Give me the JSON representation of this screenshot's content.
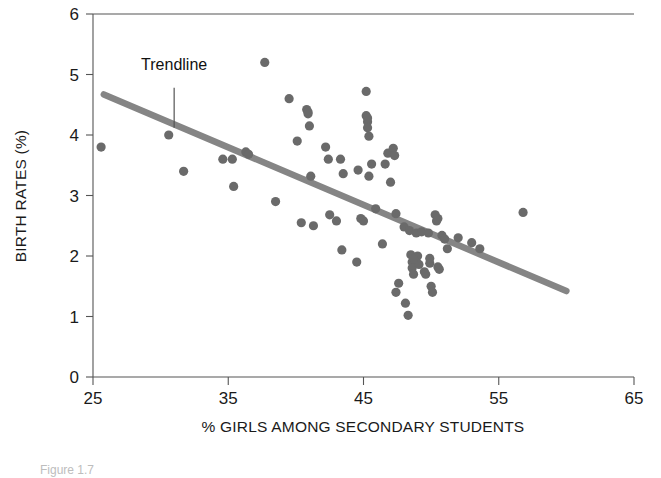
{
  "chart_data": {
    "type": "scatter",
    "title": "",
    "xlabel": "% GIRLS AMONG SECONDARY STUDENTS",
    "ylabel": "BIRTH RATES (%)",
    "xlim": [
      25,
      65
    ],
    "ylim": [
      0,
      6
    ],
    "xticks": [
      25,
      35,
      45,
      55,
      65
    ],
    "yticks": [
      0,
      1,
      2,
      3,
      4,
      5,
      6
    ],
    "xtick_labels": [
      "25",
      "35",
      "45",
      "55",
      "65"
    ],
    "ytick_labels": [
      "0",
      "1",
      "2",
      "3",
      "4",
      "5",
      "6"
    ],
    "grid": false,
    "legend": false,
    "point_color": "#6a6a6a",
    "trendline_color": "#858585",
    "annotations": [
      {
        "label": "Trendline",
        "text_x": 31.0,
        "text_y": 5.07,
        "leader_from_y": 4.78,
        "leader_to_y": 4.12
      }
    ],
    "trendline": {
      "type": "line",
      "x": [
        25.8,
        60.0
      ],
      "y": [
        4.67,
        1.42
      ]
    },
    "points": [
      [
        25.6,
        3.8
      ],
      [
        30.6,
        4.0
      ],
      [
        31.7,
        3.4
      ],
      [
        34.6,
        3.6
      ],
      [
        35.3,
        3.6
      ],
      [
        35.4,
        3.15
      ],
      [
        36.3,
        3.72
      ],
      [
        36.5,
        3.68
      ],
      [
        37.7,
        5.2
      ],
      [
        38.5,
        2.9
      ],
      [
        39.5,
        4.6
      ],
      [
        40.1,
        3.9
      ],
      [
        40.4,
        2.55
      ],
      [
        40.8,
        4.42
      ],
      [
        40.9,
        4.35
      ],
      [
        41.0,
        4.15
      ],
      [
        41.1,
        3.32
      ],
      [
        41.3,
        2.5
      ],
      [
        42.2,
        3.8
      ],
      [
        42.4,
        3.6
      ],
      [
        42.5,
        2.68
      ],
      [
        43.0,
        2.58
      ],
      [
        43.3,
        3.6
      ],
      [
        43.4,
        2.1
      ],
      [
        43.5,
        3.36
      ],
      [
        44.5,
        1.9
      ],
      [
        44.6,
        3.42
      ],
      [
        44.8,
        2.62
      ],
      [
        45.0,
        2.58
      ],
      [
        45.2,
        4.72
      ],
      [
        45.2,
        4.32
      ],
      [
        45.3,
        4.22
      ],
      [
        45.3,
        4.12
      ],
      [
        45.4,
        3.98
      ],
      [
        45.4,
        3.32
      ],
      [
        45.6,
        3.52
      ],
      [
        45.9,
        2.78
      ],
      [
        46.4,
        2.2
      ],
      [
        46.6,
        3.52
      ],
      [
        46.8,
        3.7
      ],
      [
        47.0,
        3.22
      ],
      [
        47.2,
        3.78
      ],
      [
        47.3,
        3.66
      ],
      [
        47.4,
        2.7
      ],
      [
        47.4,
        1.4
      ],
      [
        47.6,
        1.55
      ],
      [
        48.0,
        2.48
      ],
      [
        48.1,
        1.22
      ],
      [
        48.3,
        1.02
      ],
      [
        48.4,
        2.42
      ],
      [
        48.5,
        2.02
      ],
      [
        48.6,
        1.9
      ],
      [
        48.6,
        1.8
      ],
      [
        48.7,
        1.7
      ],
      [
        48.9,
        2.38
      ],
      [
        49.0,
        2.0
      ],
      [
        49.1,
        1.86
      ],
      [
        49.3,
        2.4
      ],
      [
        49.5,
        1.74
      ],
      [
        49.6,
        1.7
      ],
      [
        49.8,
        2.38
      ],
      [
        49.9,
        1.88
      ],
      [
        50.0,
        1.5
      ],
      [
        50.1,
        1.4
      ],
      [
        50.3,
        2.68
      ],
      [
        50.4,
        2.58
      ],
      [
        50.5,
        1.82
      ],
      [
        50.6,
        1.78
      ],
      [
        50.8,
        2.34
      ],
      [
        51.0,
        2.28
      ],
      [
        51.2,
        2.12
      ],
      [
        52.0,
        2.3
      ],
      [
        53.0,
        2.22
      ],
      [
        53.6,
        2.12
      ],
      [
        56.8,
        2.72
      ],
      [
        40.9,
        4.38
      ],
      [
        45.3,
        4.28
      ],
      [
        48.7,
        1.95
      ],
      [
        49.9,
        1.96
      ],
      [
        50.5,
        2.62
      ]
    ]
  },
  "caption": {
    "text": "Figure 1.7"
  }
}
